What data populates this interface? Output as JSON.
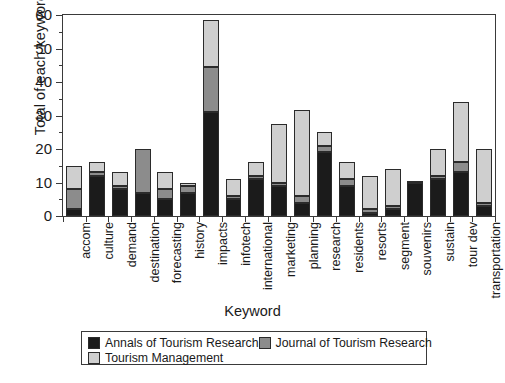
{
  "chart_data": {
    "type": "bar",
    "subtype": "stacked-vertical",
    "title": "",
    "xlabel": "Keyword",
    "ylabel": "Total of each keyword",
    "ylim": [
      0,
      60
    ],
    "yticks": [
      0,
      10,
      20,
      30,
      40,
      50,
      60
    ],
    "ytick_labels": [
      "0",
      "10",
      "20",
      "30",
      "40",
      "50",
      "60"
    ],
    "yminor_ticks": [
      5,
      15,
      25,
      35,
      45,
      55
    ],
    "grid": false,
    "legend_position": "bottom",
    "categories": [
      "accom",
      "culture",
      "demand",
      "destination",
      "forecasting",
      "history",
      "impacts",
      "infotech",
      "international",
      "marketing",
      "planning",
      "research",
      "residents",
      "resorts",
      "segment",
      "souvenirs",
      "sustain",
      "tour dev",
      "transportation"
    ],
    "series": [
      {
        "name": "Annals of Tourism Research",
        "color": "#1b1b1b",
        "values": [
          2,
          12,
          8,
          7,
          5,
          7,
          31,
          5,
          11,
          9,
          4,
          19,
          9,
          1,
          2,
          10,
          11,
          13,
          3
        ]
      },
      {
        "name": "Journal of Tourism Research",
        "color": "#8c8c8c",
        "values": [
          6,
          1,
          1,
          13,
          3,
          2,
          13.5,
          1,
          1,
          1,
          2,
          2,
          2,
          1,
          1,
          0.5,
          1,
          3,
          1
        ]
      },
      {
        "name": "Tourism Management",
        "color": "#cfcfcf",
        "values": [
          7,
          3,
          4,
          0,
          5,
          1,
          14,
          5,
          4,
          17.5,
          25.5,
          4,
          5,
          10,
          11,
          0,
          8,
          18,
          16
        ]
      }
    ],
    "totals": [
      15,
      16,
      13,
      20,
      13,
      10,
      58.5,
      11,
      16,
      27.5,
      31.5,
      25,
      16,
      12,
      14,
      10.5,
      20,
      34,
      20
    ]
  },
  "legend": {
    "entries": [
      "Annals of Tourism Research",
      "Journal of Tourism Research",
      "Tourism Management"
    ]
  }
}
